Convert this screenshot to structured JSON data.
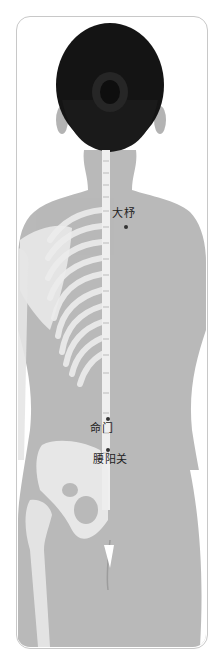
{
  "figure": {
    "colors": {
      "skin": "#b9b9b9",
      "skin_shadow": "#a8a8a8",
      "hair": "#141414",
      "bone": "#eeeeee",
      "frame_border": "#c8c8c8",
      "point": "#333333"
    }
  },
  "acupoints": [
    {
      "name": "大杼",
      "label_x": 112,
      "label_y": 210,
      "dot_x": 126,
      "dot_y": 227
    },
    {
      "name": "命门",
      "label_x": 91,
      "label_y": 424,
      "dot_x": 108,
      "dot_y": 419
    },
    {
      "name": "腰阳关",
      "label_x": 94,
      "label_y": 455,
      "dot_x": 108,
      "dot_y": 450
    }
  ]
}
